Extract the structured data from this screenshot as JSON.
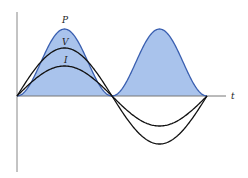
{
  "diagram": {
    "title": "",
    "labels": {
      "power": "P",
      "voltage": "V",
      "current": "I",
      "time_axis": "t"
    },
    "colors": {
      "power_fill": "#a9c3ec",
      "power_stroke": "#3a5fb0",
      "voltage_stroke": "#111111",
      "current_stroke": "#111111",
      "axis": "#777777"
    },
    "curves": [
      {
        "name": "P",
        "shape": "sin^2 (always >= 0, shaded)",
        "peak_px": 67
      },
      {
        "name": "V",
        "shape": "sine",
        "amplitude_px": 48
      },
      {
        "name": "I",
        "shape": "sine, in phase with V",
        "amplitude_px": 30
      }
    ],
    "periods_shown": 1
  }
}
